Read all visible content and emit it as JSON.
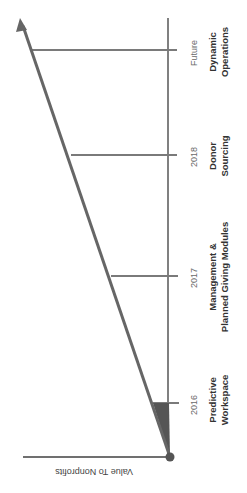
{
  "diagram": {
    "type": "timeline-value-ramp",
    "rotation_deg": 90,
    "axis_label": "Value To Nonprofits",
    "colors": {
      "line": "#707070",
      "fill": "#555555",
      "text": "#333333"
    },
    "milestones": [
      {
        "year": "2016",
        "label_line1": "Predictive",
        "label_line2": "Workspace"
      },
      {
        "year": "2017",
        "label_line1": "Management &",
        "label_line2": "Planned Giving Modules"
      },
      {
        "year": "2018",
        "label_line1": "Donor",
        "label_line2": "Sourcing"
      },
      {
        "year": "Future",
        "label_line1": "Dynamic",
        "label_line2": "Operations"
      }
    ]
  }
}
